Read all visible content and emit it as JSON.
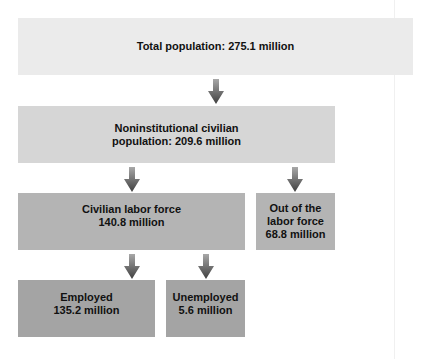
{
  "colors": {
    "level1": "#ebebeb",
    "level2": "#d6d6d6",
    "level3": "#b4b4b4",
    "level4": "#a4a4a4",
    "arrow_top": "#9a9a9a",
    "arrow_bottom": "#4a4a4a"
  },
  "nodes": {
    "total": {
      "label": "Total population: 275.1 million"
    },
    "noninstitutional": {
      "line1": "Noninstitutional civilian",
      "line2": "population: 209.6 million"
    },
    "labor_force": {
      "line1": "Civilian labor force",
      "line2": "140.8 million"
    },
    "out_of_labor": {
      "line1": "Out of the",
      "line2": "labor force",
      "line3": "68.8 million"
    },
    "employed": {
      "line1": "Employed",
      "line2": "135.2 million"
    },
    "unemployed": {
      "line1": "Unemployed",
      "line2": "5.6 million"
    }
  },
  "edges": [
    {
      "from": "total",
      "to": "noninstitutional"
    },
    {
      "from": "noninstitutional",
      "to": "labor_force"
    },
    {
      "from": "noninstitutional",
      "to": "out_of_labor"
    },
    {
      "from": "labor_force",
      "to": "employed"
    },
    {
      "from": "labor_force",
      "to": "unemployed"
    }
  ],
  "icons": {
    "arrow": "down-arrow-icon"
  }
}
